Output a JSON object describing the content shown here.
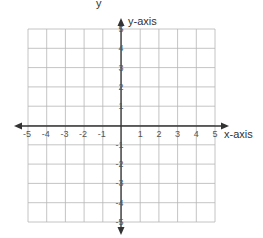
{
  "top_fragment": "y",
  "grid": {
    "x_min": -5,
    "x_max": 5,
    "y_min": -5,
    "y_max": 5,
    "grid_color": "#b5b5b5",
    "axis_color": "#333333"
  },
  "axes": {
    "x_label": "x-axis",
    "y_label": "y-axis",
    "x_ticks": [
      "-5",
      "-4",
      "-3",
      "-2",
      "-1",
      "1",
      "2",
      "3",
      "4",
      "5"
    ],
    "y_ticks": [
      "5",
      "4",
      "3",
      "2",
      "1",
      "-1",
      "-2",
      "-3",
      "-4",
      "-5"
    ]
  },
  "chart_data": {
    "type": "scatter",
    "title": "",
    "xlabel": "x-axis",
    "ylabel": "y-axis",
    "xlim": [
      -5,
      5
    ],
    "ylim": [
      -5,
      5
    ],
    "grid": true,
    "x_ticks": [
      -5,
      -4,
      -3,
      -2,
      -1,
      1,
      2,
      3,
      4,
      5
    ],
    "y_ticks": [
      -5,
      -4,
      -3,
      -2,
      -1,
      1,
      2,
      3,
      4,
      5
    ],
    "series": []
  }
}
